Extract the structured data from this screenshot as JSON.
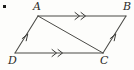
{
  "figure": {
    "kind": "geometry-diagram",
    "shape": "parallelogram",
    "background_color": "#fdfdfb",
    "stroke_color": "#4a4a46",
    "label_color": "#2b2b28",
    "bullet": {
      "name": "list-bullet",
      "color": "#1c1c1a"
    },
    "vertices": [
      {
        "id": "A",
        "label": "A",
        "x": 38,
        "y": 16
      },
      {
        "id": "B",
        "label": "B",
        "x": 126,
        "y": 16
      },
      {
        "id": "C",
        "label": "C",
        "x": 103,
        "y": 53
      },
      {
        "id": "D",
        "label": "D",
        "x": 15,
        "y": 53
      }
    ],
    "edges": [
      {
        "id": "AB",
        "from": "A",
        "to": "B",
        "ticks": 2,
        "style": "solid"
      },
      {
        "id": "DC",
        "from": "D",
        "to": "C",
        "ticks": 2,
        "style": "solid"
      },
      {
        "id": "DA",
        "from": "D",
        "to": "A",
        "ticks": 1,
        "style": "solid"
      },
      {
        "id": "CB",
        "from": "C",
        "to": "B",
        "ticks": 1,
        "style": "solid"
      }
    ],
    "diagonals": [
      {
        "id": "AC",
        "from": "A",
        "to": "C",
        "ticks": 0,
        "style": "solid"
      }
    ]
  }
}
